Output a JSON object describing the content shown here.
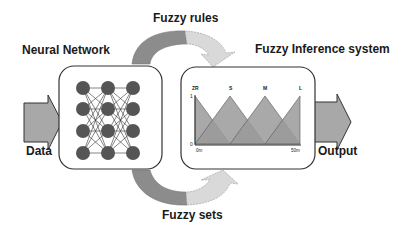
{
  "labels": {
    "neural_network": "Neural Network",
    "fuzzy_rules": "Fuzzy rules",
    "fuzzy_inference": "Fuzzy Inference system",
    "fuzzy_sets": "Fuzzy sets",
    "data": "Data",
    "output": "Output"
  },
  "neural_network": {
    "layers": 3,
    "nodes_per_layer": 4,
    "node_color": "#555555"
  },
  "membership_chart": {
    "sets": [
      "ZR",
      "S",
      "M",
      "L"
    ],
    "y_ticks": [
      "1",
      "0"
    ],
    "x_ticks": [
      "0m",
      "50m"
    ],
    "fill_color": "#9a9a9a"
  },
  "colors": {
    "arrow_dark": "#8c8c8c",
    "arrow_light": "#d9d9d9",
    "box_border": "#333333",
    "io_arrow": "#a8a8a8"
  }
}
